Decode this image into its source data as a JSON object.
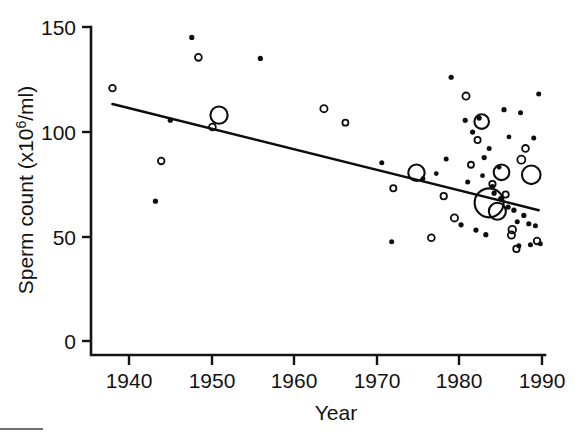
{
  "figure": {
    "background_color": "#ffffff",
    "ink_color": "#111111",
    "caption_rule_color": "#6f6f6f"
  },
  "chart_data": {
    "type": "scatter",
    "title": "",
    "xlabel": "Year",
    "ylabel": "Sperm count (x10",
    "ylabel_sup": "6",
    "ylabel_tail": "/ml)",
    "xlim": [
      1937,
      1991
    ],
    "ylim": [
      0,
      150
    ],
    "xticks": [
      1940,
      1950,
      1960,
      1970,
      1980,
      1990
    ],
    "xtick_labels": [
      "1940",
      "1950",
      "1960",
      "1970",
      "1980",
      "1990"
    ],
    "yticks": [
      0,
      50,
      100,
      150
    ],
    "ytick_labels": [
      "0",
      "50",
      "100",
      "150"
    ],
    "grid": false,
    "legend": "none",
    "marker_note": "Circle area is proportional to study sample size; open and filled circles both present",
    "trendline": {
      "name": "linear regression",
      "x": [
        1938,
        1989.6
      ],
      "y": [
        113.2,
        62.5
      ],
      "slope_per_year": -0.98
    },
    "series": [
      {
        "name": "Studies (open circles)",
        "marker": "open-circle",
        "points": [
          {
            "x": 1938.0,
            "y": 120.8,
            "r": 3.3
          },
          {
            "x": 1948.4,
            "y": 135.5,
            "r": 3.4
          },
          {
            "x": 1943.9,
            "y": 86.0,
            "r": 3.3
          },
          {
            "x": 1950.9,
            "y": 107.9,
            "r": 8.6
          },
          {
            "x": 1950.1,
            "y": 102.2,
            "r": 3.4
          },
          {
            "x": 1963.6,
            "y": 111.0,
            "r": 3.6
          },
          {
            "x": 1966.2,
            "y": 104.3,
            "r": 3.0
          },
          {
            "x": 1974.8,
            "y": 80.4,
            "r": 8.2
          },
          {
            "x": 1972.0,
            "y": 73.0,
            "r": 3.1
          },
          {
            "x": 1976.6,
            "y": 49.3,
            "r": 3.4
          },
          {
            "x": 1978.1,
            "y": 69.2,
            "r": 3.2
          },
          {
            "x": 1979.4,
            "y": 58.8,
            "r": 3.6
          },
          {
            "x": 1982.7,
            "y": 104.8,
            "r": 7.3
          },
          {
            "x": 1983.6,
            "y": 66.0,
            "r": 14.5
          },
          {
            "x": 1984.6,
            "y": 62.0,
            "r": 8.5
          },
          {
            "x": 1985.1,
            "y": 80.6,
            "r": 7.8
          },
          {
            "x": 1988.7,
            "y": 79.4,
            "r": 9.3
          },
          {
            "x": 1987.5,
            "y": 86.6,
            "r": 4.0
          },
          {
            "x": 1986.4,
            "y": 53.2,
            "r": 3.8
          },
          {
            "x": 1986.3,
            "y": 50.6,
            "r": 3.6
          },
          {
            "x": 1989.4,
            "y": 47.8,
            "r": 3.3
          },
          {
            "x": 1980.8,
            "y": 117.0,
            "r": 3.6
          },
          {
            "x": 1984.0,
            "y": 75.0,
            "r": 3.2
          },
          {
            "x": 1981.4,
            "y": 84.2,
            "r": 3.0
          },
          {
            "x": 1982.2,
            "y": 96.0,
            "r": 3.1
          },
          {
            "x": 1985.6,
            "y": 70.0,
            "r": 3.1
          },
          {
            "x": 1988.0,
            "y": 92.0,
            "r": 3.4
          },
          {
            "x": 1986.9,
            "y": 44.0,
            "r": 3.2
          }
        ]
      },
      {
        "name": "Studies (filled circles)",
        "marker": "filled-circle",
        "points": [
          {
            "x": 1947.6,
            "y": 145.0,
            "r": 2.6
          },
          {
            "x": 1955.9,
            "y": 135.0,
            "r": 2.6
          },
          {
            "x": 1945.0,
            "y": 105.5,
            "r": 2.6
          },
          {
            "x": 1943.2,
            "y": 66.8,
            "r": 2.6
          },
          {
            "x": 1970.6,
            "y": 85.2,
            "r": 2.5
          },
          {
            "x": 1971.8,
            "y": 47.4,
            "r": 2.5
          },
          {
            "x": 1975.6,
            "y": 77.5,
            "r": 2.4
          },
          {
            "x": 1979.0,
            "y": 126.0,
            "r": 2.6
          },
          {
            "x": 1980.7,
            "y": 105.4,
            "r": 2.6
          },
          {
            "x": 1981.6,
            "y": 99.8,
            "r": 2.6
          },
          {
            "x": 1982.4,
            "y": 106.5,
            "r": 2.6
          },
          {
            "x": 1983.0,
            "y": 87.6,
            "r": 2.6
          },
          {
            "x": 1983.6,
            "y": 92.0,
            "r": 2.5
          },
          {
            "x": 1984.2,
            "y": 70.6,
            "r": 2.6
          },
          {
            "x": 1984.0,
            "y": 73.8,
            "r": 2.6
          },
          {
            "x": 1985.0,
            "y": 68.0,
            "r": 2.6
          },
          {
            "x": 1985.9,
            "y": 64.0,
            "r": 2.6
          },
          {
            "x": 1986.6,
            "y": 62.5,
            "r": 2.6
          },
          {
            "x": 1987.0,
            "y": 57.0,
            "r": 2.5
          },
          {
            "x": 1987.8,
            "y": 60.0,
            "r": 2.6
          },
          {
            "x": 1988.4,
            "y": 56.0,
            "r": 2.6
          },
          {
            "x": 1989.2,
            "y": 55.0,
            "r": 2.5
          },
          {
            "x": 1989.8,
            "y": 46.5,
            "r": 2.5
          },
          {
            "x": 1988.6,
            "y": 46.0,
            "r": 2.5
          },
          {
            "x": 1987.2,
            "y": 45.5,
            "r": 2.5
          },
          {
            "x": 1983.2,
            "y": 50.8,
            "r": 2.6
          },
          {
            "x": 1982.0,
            "y": 53.0,
            "r": 2.6
          },
          {
            "x": 1980.2,
            "y": 55.5,
            "r": 2.6
          },
          {
            "x": 1978.4,
            "y": 87.0,
            "r": 2.5
          },
          {
            "x": 1981.0,
            "y": 76.0,
            "r": 2.5
          },
          {
            "x": 1985.4,
            "y": 110.5,
            "r": 2.6
          },
          {
            "x": 1987.4,
            "y": 109.0,
            "r": 2.5
          },
          {
            "x": 1989.0,
            "y": 97.0,
            "r": 2.5
          },
          {
            "x": 1989.6,
            "y": 118.0,
            "r": 2.5
          },
          {
            "x": 1986.0,
            "y": 97.5,
            "r": 2.4
          },
          {
            "x": 1984.8,
            "y": 83.0,
            "r": 2.4
          },
          {
            "x": 1982.8,
            "y": 79.0,
            "r": 2.4
          },
          {
            "x": 1977.2,
            "y": 80.0,
            "r": 2.4
          }
        ]
      }
    ]
  }
}
